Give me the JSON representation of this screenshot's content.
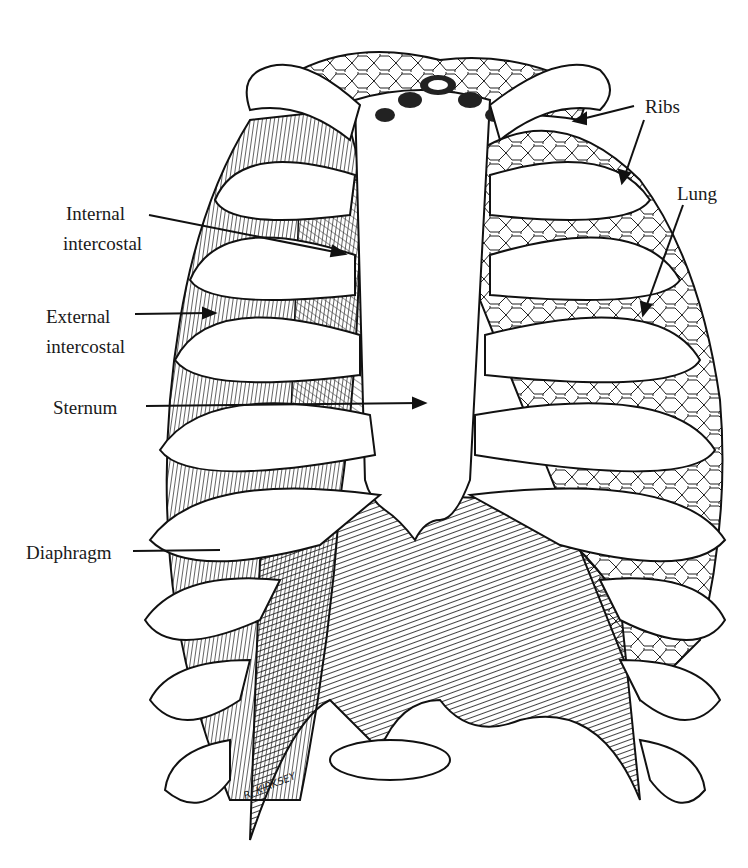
{
  "diagram": {
    "title": "",
    "labels": {
      "ribs": "Ribs",
      "lung": "Lung",
      "internal_intercostal_1": "Internal",
      "internal_intercostal_2": "intercostal",
      "external_intercostal_1": "External",
      "external_intercostal_2": "intercostal",
      "sternum": "Sternum",
      "diaphragm": "Diaphragm"
    },
    "signature": "R. KIRKSEY",
    "colors": {
      "ink": "#1a1a1a",
      "paper": "#ffffff"
    }
  }
}
